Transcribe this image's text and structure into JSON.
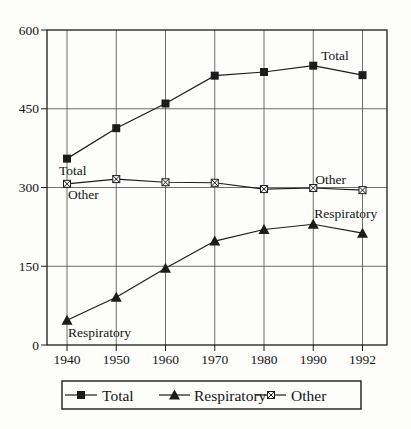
{
  "chart_data": {
    "type": "line",
    "title": "",
    "xlabel": "",
    "ylabel": "",
    "categories": [
      "1940",
      "1950",
      "1960",
      "1970",
      "1980",
      "1990",
      "1992"
    ],
    "series": [
      {
        "name": "Total",
        "marker": "filled-square",
        "values": [
          355,
          413,
          460,
          513,
          520,
          532,
          514
        ]
      },
      {
        "name": "Respiratory",
        "marker": "filled-triangle",
        "values": [
          47,
          91,
          146,
          198,
          220,
          230,
          213
        ]
      },
      {
        "name": "Other",
        "marker": "crossed-square",
        "values": [
          307,
          316,
          310,
          309,
          297,
          299,
          295
        ]
      }
    ],
    "ylim": [
      0,
      600
    ],
    "yticks": [
      0,
      150,
      300,
      450,
      600
    ],
    "ytick_labels": [
      "0",
      "150",
      "300",
      "450",
      "600"
    ],
    "grid": true,
    "legend_position": "bottom",
    "legend_labels": [
      "Total",
      "Respiratory",
      "Other"
    ],
    "annotations": [
      {
        "label": "Total",
        "series": "Total",
        "category": "1940",
        "dx": -8,
        "dy": 16
      },
      {
        "label": "Total",
        "series": "Total",
        "category": "1990",
        "dx": 8,
        "dy": -6
      },
      {
        "label": "Other",
        "series": "Other",
        "category": "1940",
        "dx": 1,
        "dy": 15
      },
      {
        "label": "Other",
        "series": "Other",
        "category": "1990",
        "dx": 2,
        "dy": -4
      },
      {
        "label": "Respiratory",
        "series": "Respiratory",
        "category": "1940",
        "dx": 1,
        "dy": 17
      },
      {
        "label": "Respiratory",
        "series": "Respiratory",
        "category": "1990",
        "dx": 1,
        "dy": -6
      }
    ],
    "colors": {
      "line": "#1c1c1c",
      "grid": "#4a4a4a",
      "frame": "#1c1c1c",
      "text": "#141414",
      "background": "#fdfdfc"
    }
  }
}
